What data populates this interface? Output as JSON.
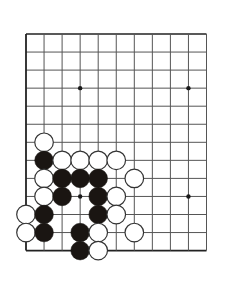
{
  "figure": {
    "caption_label": "问題",
    "caption_number": "113",
    "marker_icon": "corner-triangle-icon"
  },
  "board": {
    "colors": {
      "background": "#ffffff",
      "line": "#555555",
      "edge_line": "#222222",
      "black_stone": "#1a1512",
      "white_stone_fill": "#ffffff",
      "white_stone_edge": "#333333",
      "star_point": "#1a1a1a",
      "caption_chip": "#e8eaec"
    },
    "geometry": {
      "origin_x": 26,
      "origin_y": 34,
      "spacing": 18.05,
      "cols_visible": 11,
      "rows_visible": 13,
      "stone_radius": 9.3
    },
    "star_points": [
      {
        "col": 3,
        "row": 3
      },
      {
        "col": 9,
        "row": 3
      },
      {
        "col": 3,
        "row": 9
      },
      {
        "col": 9,
        "row": 9
      }
    ],
    "stones": [
      {
        "col": 1,
        "row": 6,
        "color": "white"
      },
      {
        "col": 1,
        "row": 7,
        "color": "black"
      },
      {
        "col": 2,
        "row": 7,
        "color": "white"
      },
      {
        "col": 3,
        "row": 7,
        "color": "white"
      },
      {
        "col": 4,
        "row": 7,
        "color": "white"
      },
      {
        "col": 5,
        "row": 7,
        "color": "white"
      },
      {
        "col": 1,
        "row": 8,
        "color": "white"
      },
      {
        "col": 2,
        "row": 8,
        "color": "black"
      },
      {
        "col": 3,
        "row": 8,
        "color": "black"
      },
      {
        "col": 4,
        "row": 8,
        "color": "black"
      },
      {
        "col": 6,
        "row": 8,
        "color": "white"
      },
      {
        "col": 1,
        "row": 9,
        "color": "white"
      },
      {
        "col": 2,
        "row": 9,
        "color": "black"
      },
      {
        "col": 4,
        "row": 9,
        "color": "black"
      },
      {
        "col": 5,
        "row": 9,
        "color": "white"
      },
      {
        "col": 0,
        "row": 10,
        "color": "white"
      },
      {
        "col": 1,
        "row": 10,
        "color": "black"
      },
      {
        "col": 4,
        "row": 10,
        "color": "black"
      },
      {
        "col": 5,
        "row": 10,
        "color": "white"
      },
      {
        "col": 0,
        "row": 11,
        "color": "white"
      },
      {
        "col": 1,
        "row": 11,
        "color": "black"
      },
      {
        "col": 3,
        "row": 11,
        "color": "black"
      },
      {
        "col": 4,
        "row": 11,
        "color": "white"
      },
      {
        "col": 6,
        "row": 11,
        "color": "white"
      },
      {
        "col": 3,
        "row": 12,
        "color": "black"
      },
      {
        "col": 4,
        "row": 12,
        "color": "white"
      }
    ]
  }
}
